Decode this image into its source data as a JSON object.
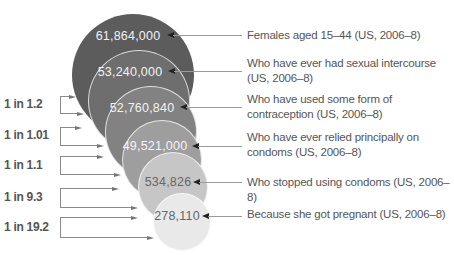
{
  "chart_data": {
    "type": "nested-bubble-funnel",
    "title": "",
    "circles": [
      {
        "value": 61864000,
        "value_label": "61,864,000",
        "label": "Females aged 15–44 (US, 2006–8)",
        "color": "#5c5c5c",
        "text_color": "#f2f2f2"
      },
      {
        "value": 53240000,
        "value_label": "53,240,000",
        "label": "Who have ever had sexual intercourse (US, 2006–8)",
        "color": "#6e6e6e",
        "text_color": "#f2f2f2"
      },
      {
        "value": 52760840,
        "value_label": "52,760,840",
        "label": "Who have used some form of contraception (US, 2006–8)",
        "color": "#828282",
        "text_color": "#f2f2f2"
      },
      {
        "value": 49521000,
        "value_label": "49,521,000",
        "label": "Who have ever relied principally on condoms (US, 2006–8)",
        "color": "#9e9e9e",
        "text_color": "#f5f5f5"
      },
      {
        "value": 534826,
        "value_label": "534,826",
        "label": "Who stopped using condoms (US, 2006–8)",
        "color": "#c6c6c6",
        "text_color": "#666666"
      },
      {
        "value": 278110,
        "value_label": "278,110",
        "label": "Because she got pregnant (US, 2006–8)",
        "color": "#e9e9e9",
        "text_color": "#666666"
      }
    ],
    "ratios": [
      "1 in 1.2",
      "1 in 1.01",
      "1 in 1.1",
      "1 in 9.3",
      "1 in 19.2"
    ]
  },
  "layout": {
    "circles": [
      {
        "cx": 133,
        "cy": 75,
        "r": 61
      },
      {
        "cx": 139,
        "cy": 101,
        "r": 51
      },
      {
        "cx": 151,
        "cy": 132,
        "r": 46
      },
      {
        "cx": 162,
        "cy": 160,
        "r": 40
      },
      {
        "cx": 173,
        "cy": 187,
        "r": 35
      },
      {
        "cx": 182,
        "cy": 222,
        "r": 29
      }
    ],
    "numbers": [
      {
        "x": 128,
        "y": 36
      },
      {
        "x": 130,
        "y": 72
      },
      {
        "x": 142,
        "y": 108
      },
      {
        "x": 155,
        "y": 146
      },
      {
        "x": 168,
        "y": 182
      },
      {
        "x": 177,
        "y": 216
      }
    ],
    "leads": [
      {
        "arrow_x": 167,
        "y": 35,
        "end_x": 242,
        "label_y": 28
      },
      {
        "arrow_x": 168,
        "y": 71,
        "end_x": 242,
        "label_y": 56
      },
      {
        "arrow_x": 180,
        "y": 107,
        "end_x": 242,
        "label_y": 92
      },
      {
        "arrow_x": 192,
        "y": 146,
        "end_x": 242,
        "label_y": 130
      },
      {
        "arrow_x": 193,
        "y": 182,
        "end_x": 242,
        "label_y": 175
      },
      {
        "arrow_x": 202,
        "y": 216,
        "end_x": 242,
        "label_y": 207
      }
    ],
    "brackets": [
      {
        "text_y": 104,
        "top": 96,
        "bottom": 113,
        "top_tip": 76,
        "bottom_tip": 84
      },
      {
        "text_y": 135,
        "top": 127,
        "bottom": 145,
        "top_tip": 82,
        "bottom_tip": 104
      },
      {
        "text_y": 165,
        "top": 156,
        "bottom": 174,
        "top_tip": 104,
        "bottom_tip": 121
      },
      {
        "text_y": 197,
        "top": 188,
        "bottom": 207,
        "top_tip": 119,
        "bottom_tip": 138
      },
      {
        "text_y": 227,
        "top": 217,
        "bottom": 237,
        "top_tip": 138,
        "bottom_tip": 154
      }
    ]
  }
}
